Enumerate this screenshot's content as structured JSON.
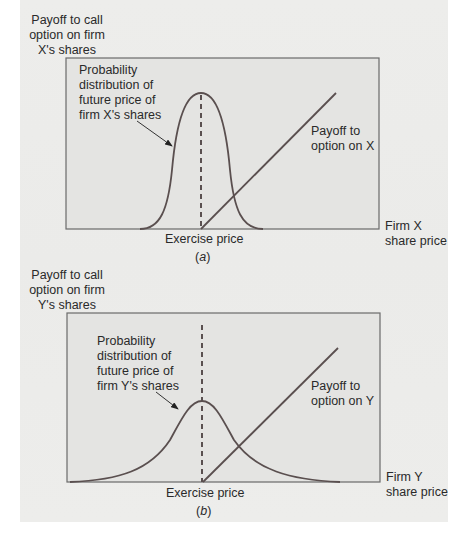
{
  "figure": {
    "background_color": "#ebebe9",
    "box_fill": "#e3e3e1",
    "line_color": "#5a5050",
    "panels": [
      {
        "id": "a",
        "y_axis_label": [
          "Payoff to call",
          "option on firm",
          "X's shares"
        ],
        "distribution_label": [
          "Probability",
          "distribution of",
          "future price of",
          "firm X's shares"
        ],
        "payoff_label": [
          "Payoff to",
          "option on X"
        ],
        "x_axis_label": [
          "Firm X",
          "share price"
        ],
        "exercise_label": "Exercise price",
        "caption_open": "(",
        "caption_letter": "a",
        "caption_close": ")",
        "distribution": "narrow"
      },
      {
        "id": "b",
        "y_axis_label": [
          "Payoff to call",
          "option on firm",
          "Y's shares"
        ],
        "distribution_label": [
          "Probability",
          "distribution of",
          "future price of",
          "firm Y's shares"
        ],
        "payoff_label": [
          "Payoff to",
          "option on Y"
        ],
        "x_axis_label": [
          "Firm Y",
          "share price"
        ],
        "exercise_label": "Exercise price",
        "caption_open": "(",
        "caption_letter": "b",
        "caption_close": ")",
        "distribution": "wide"
      }
    ]
  }
}
